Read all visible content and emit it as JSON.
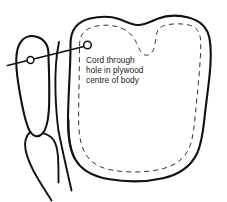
{
  "diagram": {
    "title": "Cord through hole in plywood centre of body",
    "type": "line-drawing-assembly-diagram",
    "background_color": "#ffffff",
    "ink_color": "#111111",
    "caption": {
      "lines": [
        "Cord through",
        "hole in plywood",
        "centre of body"
      ],
      "full_text": "Cord through hole in plywood centre of body"
    },
    "parts": {
      "body": {
        "label": "body",
        "description": "large plywood body piece with shoulders and neck notch",
        "stitch_line": "dashed inner outline"
      },
      "arm": {
        "label": "arm",
        "description": "elongated limb piece at left with pivot hole"
      },
      "lower_limb": {
        "label": "lower limb",
        "description": "smaller jointed piece below the arm"
      },
      "cord": {
        "label": "cord",
        "description": "line passing from left edge through arm hole into body hole"
      },
      "body_hole": {
        "label": "hole in plywood centre of body"
      },
      "arm_hole": {
        "label": "hole in arm"
      }
    }
  }
}
